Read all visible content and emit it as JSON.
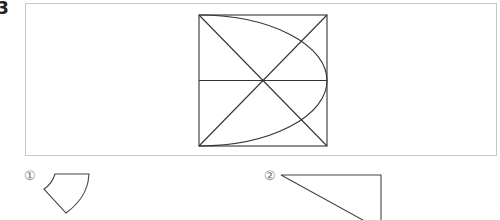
{
  "problem": {
    "number": "3"
  },
  "figure": {
    "square": {
      "x": 199,
      "y": 15,
      "size": 128
    },
    "stroke_color": "#333333",
    "frame_color": "#c8c8c8"
  },
  "choices": [
    {
      "label": "①",
      "shape": "curved pentagon piece"
    },
    {
      "label": "②",
      "shape": "right triangle piece"
    }
  ]
}
